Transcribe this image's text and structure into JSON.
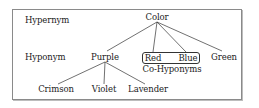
{
  "diagram": {
    "type": "hierarchy-tree",
    "row_labels": {
      "hypernym": "Hypernym",
      "hyponym": "Hyponym"
    },
    "nodes": {
      "color": "Color",
      "purple": "Purple",
      "red": "Red",
      "blue": "Blue",
      "green": "Green",
      "crimson": "Crimson",
      "violet": "Violet",
      "lavender": "Lavender"
    },
    "group_label": "Co-Hyponyms",
    "edges": [
      [
        "Color",
        "Purple"
      ],
      [
        "Color",
        "Red"
      ],
      [
        "Color",
        "Blue"
      ],
      [
        "Color",
        "Green"
      ],
      [
        "Purple",
        "Crimson"
      ],
      [
        "Purple",
        "Violet"
      ],
      [
        "Purple",
        "Lavender"
      ]
    ],
    "colors": {
      "border": "#8a8a8a",
      "text": "#222222",
      "lines": "#333333"
    }
  }
}
